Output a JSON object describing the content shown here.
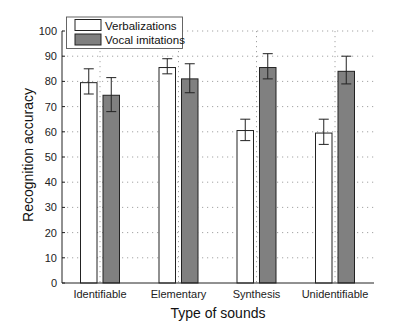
{
  "chart_data": {
    "type": "bar",
    "title": "",
    "xlabel": "Type of sounds",
    "ylabel": "Recognition accuracy",
    "categories": [
      "Identifiable",
      "Elementary",
      "Synthesis",
      "Unidentifiable"
    ],
    "series": [
      {
        "name": "Verbalizations",
        "color": "#ffffff",
        "values": [
          79.5,
          85.5,
          60.5,
          59.5
        ],
        "error_low": [
          75,
          83,
          56.5,
          55
        ],
        "error_high": [
          85,
          89,
          65,
          65
        ]
      },
      {
        "name": "Vocal imitations",
        "color": "#808080",
        "values": [
          74.5,
          81,
          85.5,
          84
        ],
        "error_low": [
          68,
          75.5,
          81,
          79
        ],
        "error_high": [
          81.5,
          87,
          91,
          90
        ]
      }
    ],
    "yticks": [
      0,
      10,
      20,
      30,
      40,
      50,
      60,
      70,
      80,
      90,
      100
    ],
    "ylim": [
      0,
      100
    ],
    "grid": true,
    "legend_position": "upper left"
  }
}
